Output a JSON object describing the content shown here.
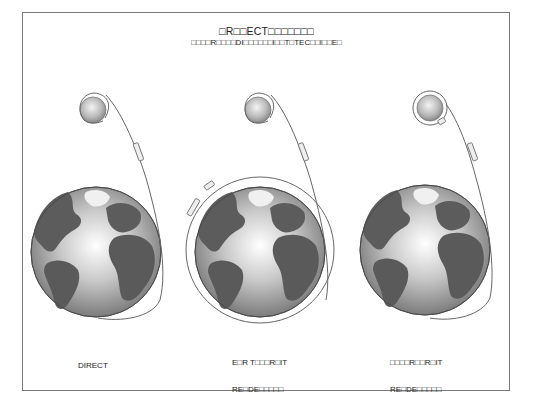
{
  "header": {
    "title": "□R□□ECT□□□□□□□",
    "subtitle": "□□□□R□□□□DI□□□□□□I□□T□TEC□□I□□E□"
  },
  "panels": [
    {
      "id": "direct",
      "label_line1": "DIRECT",
      "label_line2": ""
    },
    {
      "id": "earth-orbit",
      "label_line1": "E□R T□□□R□IT",
      "label_line2": "RE□DE□□□□□"
    },
    {
      "id": "lunar-orbit",
      "label_line1": "□□□□R□□R□IT",
      "label_line2": "RE□DE□□□□□"
    }
  ],
  "colors": {
    "frame": "#7a7a7a",
    "ocean_light": "#f2f2f2",
    "ocean_dark": "#8a8a8a",
    "land": "#5a5a5a",
    "trajectory": "#555555"
  }
}
